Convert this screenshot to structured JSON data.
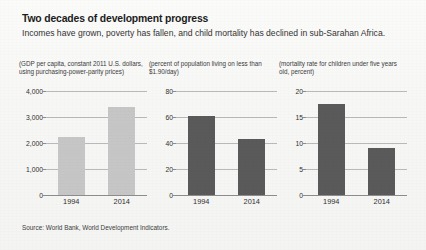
{
  "figure": {
    "title": "Two decades of development progress",
    "subtitle": "Incomes have grown, poverty has fallen, and child mortality has declined in sub-Sarahan Africa.",
    "source": "Source: World Bank, World Development Indicators.",
    "colors": {
      "bar_light": "#c6c6c6",
      "bar_dark": "#5a5a5a",
      "gridline": "#b9b9b9",
      "axis": "#8d8d8d",
      "text": "#2b2b2b",
      "background": "#f7f7f6"
    }
  },
  "chart_data": [
    {
      "type": "bar",
      "title": "(GDP per capita, constant 2011 U.S. dollars, using purchasing-power-parity prices)",
      "categories": [
        "1994",
        "2014"
      ],
      "values": [
        2250,
        3400
      ],
      "ticks": [
        "0",
        "1,000",
        "2,000",
        "3,000",
        "4,000"
      ],
      "tick_values": [
        0,
        1000,
        2000,
        3000,
        4000
      ],
      "ylim": [
        0,
        4000
      ],
      "xlabel": "",
      "ylabel": "",
      "grid": true,
      "legend": "none",
      "bar_color": "#c6c6c6"
    },
    {
      "type": "bar",
      "title": "(percent of population living on less than $1.90/day)",
      "categories": [
        "1994",
        "2014"
      ],
      "values": [
        61,
        43
      ],
      "ticks": [
        "0",
        "20",
        "40",
        "60",
        "80"
      ],
      "tick_values": [
        0,
        20,
        40,
        60,
        80
      ],
      "ylim": [
        0,
        80
      ],
      "xlabel": "",
      "ylabel": "",
      "grid": true,
      "legend": "none",
      "bar_color": "#5a5a5a"
    },
    {
      "type": "bar",
      "title": "(mortality rate for children under five years old, percent)",
      "categories": [
        "1994",
        "2014"
      ],
      "values": [
        17.5,
        9
      ],
      "ticks": [
        "0",
        "5",
        "10",
        "15",
        "20"
      ],
      "tick_values": [
        0,
        5,
        10,
        15,
        20
      ],
      "ylim": [
        0,
        20
      ],
      "xlabel": "",
      "ylabel": "",
      "grid": true,
      "legend": "none",
      "bar_color": "#5a5a5a"
    }
  ]
}
